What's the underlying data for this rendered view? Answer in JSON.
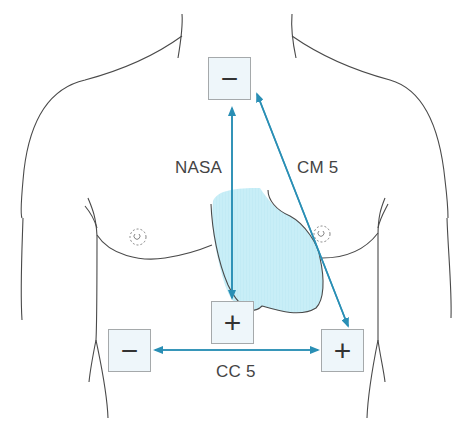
{
  "diagram": {
    "colors": {
      "outline": "#4a4a4a",
      "heart_fill": "#c8eef7",
      "lead_arrow": "#2a8fb5",
      "electrode_fill": "#eef6fa",
      "electrode_border": "#a5a9ab"
    },
    "leads": [
      {
        "name": "NASA",
        "label": "NASA",
        "from": "manubrium-negative",
        "to": "xiphoid-positive"
      },
      {
        "name": "CM5",
        "label": "CM 5",
        "from": "manubrium-negative",
        "to": "v5-positive"
      },
      {
        "name": "CC5",
        "label": "CC 5",
        "from": "right-negative",
        "to": "v5-positive"
      }
    ],
    "electrodes": [
      {
        "id": "manubrium-negative",
        "symbol": "−",
        "polarity": "negative"
      },
      {
        "id": "xiphoid-positive",
        "symbol": "+",
        "polarity": "positive"
      },
      {
        "id": "right-negative",
        "symbol": "−",
        "polarity": "negative"
      },
      {
        "id": "v5-positive",
        "symbol": "+",
        "polarity": "positive"
      }
    ]
  }
}
